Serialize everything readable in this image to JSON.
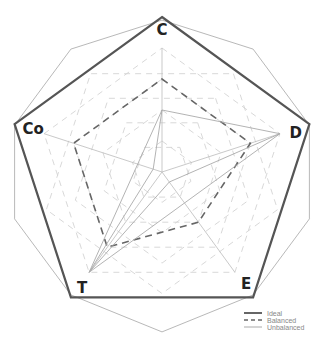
{
  "chart_data": {
    "type": "radar",
    "title": "",
    "axes": [
      "C",
      "D",
      "E",
      "T",
      "Co"
    ],
    "range": [
      0,
      5
    ],
    "grid_levels": [
      1,
      2,
      3,
      4,
      5
    ],
    "series": [
      {
        "name": "Ideal",
        "style": "solid-thick",
        "color": "#555555",
        "values": [
          5,
          5,
          5,
          5,
          5
        ]
      },
      {
        "name": "Balanced",
        "style": "dashed",
        "color": "#666666",
        "values": [
          3,
          3,
          2,
          3,
          3
        ]
      },
      {
        "name": "Unbalanced",
        "style": "solid-thin",
        "color": "#aaaaaa",
        "values": [
          2,
          4,
          0.4,
          4,
          0.3
        ]
      }
    ],
    "outer_decagon": true,
    "grid": "dashed",
    "legend_position": "bottom-right"
  },
  "legend": {
    "items": [
      {
        "label": "Ideal"
      },
      {
        "label": "Balanced"
      },
      {
        "label": "Unbalanced"
      }
    ]
  },
  "colors": {
    "ideal": "#555555",
    "balanced": "#666666",
    "unbalanced": "#aaaaaa",
    "grid": "#d4d4d4",
    "outer": "#b0b0b0",
    "label": "#222222"
  }
}
